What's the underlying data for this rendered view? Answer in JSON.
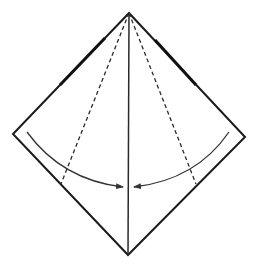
{
  "diagram": {
    "type": "origami-fold-step",
    "colors": {
      "background": "#ffffff",
      "outline": "#1a1a1a",
      "crease": "#2a2a2a",
      "arrow": "#333333"
    },
    "square": {
      "top": [
        129,
        13
      ],
      "right": [
        245,
        137
      ],
      "bottom": [
        128,
        255
      ],
      "left": [
        13,
        134
      ]
    },
    "center_crease": {
      "from": [
        129,
        13
      ],
      "to": [
        128,
        255
      ]
    },
    "valley_folds": [
      {
        "name": "left",
        "from": [
          129,
          13
        ],
        "to": [
          61,
          184
        ]
      },
      {
        "name": "right",
        "from": [
          129,
          13
        ],
        "to": [
          196,
          184
        ]
      }
    ],
    "arrows": [
      {
        "name": "left",
        "from": [
          27,
          132
        ],
        "to": [
          123,
          187
        ]
      },
      {
        "name": "right",
        "from": [
          229,
          132
        ],
        "to": [
          134,
          187
        ]
      }
    ]
  }
}
